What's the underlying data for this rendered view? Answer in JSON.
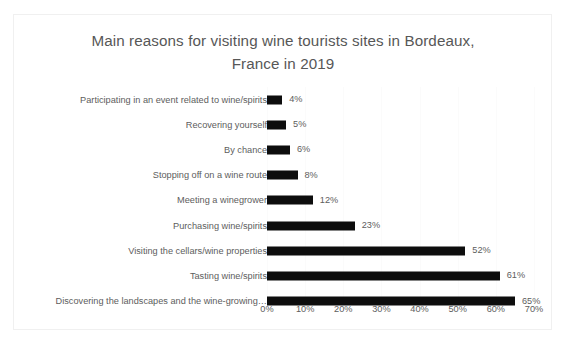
{
  "chart_data": {
    "type": "bar",
    "orientation": "horizontal",
    "title": "Main reasons for visiting wine tourists sites in Bordeaux,\nFrance in 2019",
    "xlabel": "",
    "ylabel": "",
    "xlim": [
      0,
      70
    ],
    "xtick_step": 10,
    "grid": true,
    "legend": "none",
    "value_suffix": "%",
    "bar_color": "#0d0d0d",
    "categories": [
      "Participating in an event related to wine/spirits",
      "Recovering yourself",
      "By chance",
      "Stopping off on a wine route",
      "Meeting a winegrower",
      "Purchasing wine/spirits",
      "Visiting the cellars/wine properties",
      "Tasting wine/spirits",
      "Discovering the landscapes and the wine-growing…"
    ],
    "values": [
      4,
      5,
      6,
      8,
      12,
      23,
      52,
      61,
      65
    ],
    "data_labels": [
      "4%",
      "5%",
      "6%",
      "8%",
      "12%",
      "23%",
      "52%",
      "61%",
      "65%"
    ],
    "xticks": [
      0,
      10,
      20,
      30,
      40,
      50,
      60,
      70
    ],
    "xticklabels": [
      "0%",
      "10%",
      "20%",
      "30%",
      "40%",
      "50%",
      "60%",
      "70%"
    ]
  },
  "colors": {
    "bar": "#0d0d0d",
    "title_text": "#575757",
    "label_text": "#5d5d5d",
    "gridline": "#fbfbfb",
    "card_border": "#f0f0f0",
    "background": "#ffffff"
  }
}
